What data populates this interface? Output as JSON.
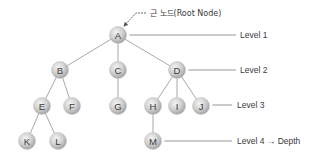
{
  "diagram": {
    "type": "tree",
    "root_annotation": "근 노드(Root Node)",
    "nodes": [
      {
        "id": "A",
        "label": "A",
        "x": 118,
        "y": 35,
        "level": 1
      },
      {
        "id": "B",
        "label": "B",
        "x": 60,
        "y": 70,
        "level": 2
      },
      {
        "id": "C",
        "label": "C",
        "x": 118,
        "y": 70,
        "level": 2
      },
      {
        "id": "D",
        "label": "D",
        "x": 177,
        "y": 70,
        "level": 2
      },
      {
        "id": "E",
        "label": "E",
        "x": 42,
        "y": 106,
        "level": 3
      },
      {
        "id": "F",
        "label": "F",
        "x": 72,
        "y": 106,
        "level": 3
      },
      {
        "id": "G",
        "label": "G",
        "x": 118,
        "y": 106,
        "level": 3
      },
      {
        "id": "H",
        "label": "H",
        "x": 153,
        "y": 106,
        "level": 3
      },
      {
        "id": "I",
        "label": "I",
        "x": 177,
        "y": 106,
        "level": 3
      },
      {
        "id": "J",
        "label": "J",
        "x": 201,
        "y": 106,
        "level": 3
      },
      {
        "id": "K",
        "label": "K",
        "x": 27,
        "y": 141,
        "level": 4
      },
      {
        "id": "L",
        "label": "L",
        "x": 58,
        "y": 141,
        "level": 4
      },
      {
        "id": "M",
        "label": "M",
        "x": 153,
        "y": 141,
        "level": 4
      }
    ],
    "edges": [
      [
        "A",
        "B"
      ],
      [
        "A",
        "C"
      ],
      [
        "A",
        "D"
      ],
      [
        "B",
        "E"
      ],
      [
        "B",
        "F"
      ],
      [
        "C",
        "G"
      ],
      [
        "D",
        "H"
      ],
      [
        "D",
        "I"
      ],
      [
        "D",
        "J"
      ],
      [
        "E",
        "K"
      ],
      [
        "E",
        "L"
      ],
      [
        "H",
        "M"
      ]
    ],
    "levels": [
      {
        "label": "Level 1",
        "from_node": "A",
        "line_end_x": 236,
        "text_x": 240,
        "y": 35
      },
      {
        "label": "Level 2",
        "from_node": "D",
        "line_end_x": 236,
        "text_x": 240,
        "y": 70
      },
      {
        "label": "Level 3",
        "from_node": "J",
        "line_end_x": 232,
        "text_x": 237,
        "y": 105
      },
      {
        "label": "Level 4 → Depth",
        "from_node": "M",
        "line_end_x": 232,
        "text_x": 237,
        "y": 141
      }
    ],
    "colors": {
      "node_fill_light": "#eeeeee",
      "node_fill_dark": "#a8a8a8",
      "edge": "#a9a9a9",
      "text": "#3a3a3a"
    }
  }
}
